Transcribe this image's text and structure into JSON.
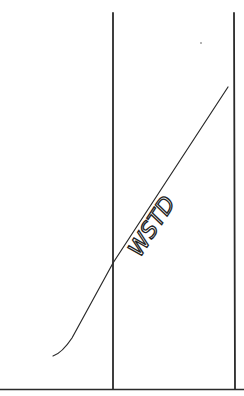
{
  "document": {
    "type": "handwritten sketch",
    "annotation": "WSTD",
    "ink_color": "#2a2a2a",
    "background_color": "#ffffff"
  }
}
